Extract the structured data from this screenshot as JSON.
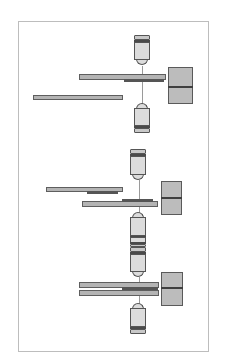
{
  "diagram": {
    "type": "optical-microscope-configurations",
    "frame": {
      "x": 18,
      "y": 21,
      "w": 191,
      "h": 331
    },
    "colors": {
      "frame": "#bdbdbd",
      "bar_fill": "#b4b4b4",
      "bar_border": "#5e5e5e",
      "sample": "#555555",
      "block_fill": "#bcbcbc",
      "objective_body": "#dcdcdc",
      "axis": "#9a9a9a"
    },
    "groups": [
      {
        "name": "configuration-1",
        "axis": {
          "x": 142,
          "y1": 66,
          "y2": 104
        },
        "objectives": [
          {
            "name": "upper-objective",
            "x": 134,
            "y": 35,
            "w": 16,
            "h": 30,
            "dir": "down"
          },
          {
            "name": "lower-objective",
            "x": 134,
            "y": 103,
            "w": 16,
            "h": 30,
            "dir": "up"
          }
        ],
        "bars": [
          {
            "name": "upper-slide",
            "x": 79,
            "y": 74,
            "w": 87,
            "h": 6
          },
          {
            "name": "left-slide",
            "x": 33,
            "y": 95,
            "w": 90,
            "h": 5
          }
        ],
        "samples": [
          {
            "name": "sample-layer",
            "x": 124,
            "y": 79,
            "w": 40,
            "h": 3
          }
        ],
        "block": {
          "x": 168,
          "y": 67,
          "w": 25,
          "h": 37,
          "gap_y": 86
        }
      },
      {
        "name": "configuration-2",
        "axis": {
          "x": 139,
          "y1": 180,
          "y2": 213
        },
        "objectives": [
          {
            "name": "upper-objective",
            "x": 130,
            "y": 149,
            "w": 16,
            "h": 31,
            "dir": "down"
          },
          {
            "name": "lower-objective",
            "x": 130,
            "y": 212,
            "w": 16,
            "h": 31,
            "dir": "up"
          }
        ],
        "bars": [
          {
            "name": "left-slide",
            "x": 46,
            "y": 187,
            "w": 77,
            "h": 5
          },
          {
            "name": "lower-slide",
            "x": 82,
            "y": 201,
            "w": 76,
            "h": 6
          }
        ],
        "samples": [
          {
            "name": "sample-under-left-slide",
            "x": 87,
            "y": 191,
            "w": 31,
            "h": 3
          },
          {
            "name": "sample-on-lower-slide",
            "x": 122,
            "y": 199,
            "w": 31,
            "h": 3
          }
        ],
        "block": {
          "x": 161,
          "y": 181,
          "w": 21,
          "h": 34,
          "gap_y": 197
        }
      },
      {
        "name": "configuration-3",
        "axis": {
          "x": 139,
          "y1": 277,
          "y2": 304
        },
        "objectives": [
          {
            "name": "top-objective-partial",
            "x": 130,
            "y": 237,
            "w": 16,
            "h": 10,
            "dir": "up"
          },
          {
            "name": "upper-objective",
            "x": 130,
            "y": 247,
            "w": 16,
            "h": 30,
            "dir": "down"
          },
          {
            "name": "lower-objective",
            "x": 130,
            "y": 303,
            "w": 16,
            "h": 31,
            "dir": "up"
          }
        ],
        "bars": [
          {
            "name": "upper-slide",
            "x": 79,
            "y": 282,
            "w": 80,
            "h": 6
          },
          {
            "name": "lower-slide",
            "x": 79,
            "y": 290,
            "w": 80,
            "h": 6
          }
        ],
        "samples": [
          {
            "name": "sample-between-slides",
            "x": 122,
            "y": 287,
            "w": 36,
            "h": 3
          }
        ],
        "block": {
          "x": 161,
          "y": 272,
          "w": 22,
          "h": 34,
          "gap_y": 287
        }
      }
    ]
  }
}
